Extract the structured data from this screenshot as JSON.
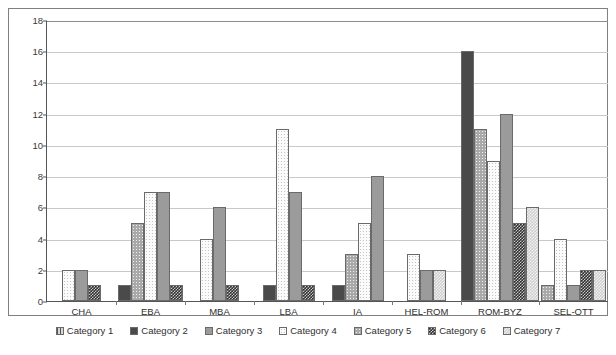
{
  "chart_data": {
    "type": "bar",
    "title": "",
    "xlabel": "",
    "ylabel": "",
    "ylim": [
      0,
      18
    ],
    "yticks": [
      0,
      2,
      4,
      6,
      8,
      10,
      12,
      14,
      16,
      18
    ],
    "grid": true,
    "legend_position": "bottom",
    "categories": [
      "CHA",
      "EBA",
      "MBA",
      "LBA",
      "IA",
      "HEL-ROM",
      "ROM-BYZ",
      "SEL-OTT"
    ],
    "series": [
      {
        "name": "Category 1",
        "values": [
          0,
          0,
          0,
          0,
          0,
          0,
          0,
          0
        ]
      },
      {
        "name": "Category 2",
        "values": [
          0,
          1,
          0,
          1,
          1,
          0,
          16,
          0
        ]
      },
      {
        "name": "Category 3",
        "values": [
          2,
          7,
          6,
          7,
          8,
          2,
          12,
          1
        ]
      },
      {
        "name": "Category 4",
        "values": [
          2,
          7,
          4,
          11,
          5,
          3,
          9,
          4
        ]
      },
      {
        "name": "Category 5",
        "values": [
          0,
          5,
          0,
          0,
          3,
          0,
          11,
          1
        ]
      },
      {
        "name": "Category 6",
        "values": [
          1,
          1,
          1,
          1,
          0,
          0,
          5,
          2
        ]
      },
      {
        "name": "Category 7",
        "values": [
          0,
          0,
          0,
          0,
          0,
          2,
          6,
          2
        ]
      }
    ],
    "bar_order_per_group": [
      [
        "Category 4",
        "Category 3",
        "Category 6"
      ],
      [
        "Category 2",
        "Category 5",
        "Category 4",
        "Category 3",
        "Category 6"
      ],
      [
        "Category 4",
        "Category 3",
        "Category 6"
      ],
      [
        "Category 2",
        "Category 4",
        "Category 3",
        "Category 6"
      ],
      [
        "Category 2",
        "Category 5",
        "Category 4",
        "Category 3"
      ],
      [
        "Category 4",
        "Category 3",
        "Category 7"
      ],
      [
        "Category 2",
        "Category 5",
        "Category 4",
        "Category 3",
        "Category 6",
        "Category 7"
      ],
      [
        "Category 5",
        "Category 4",
        "Category 3",
        "Category 6",
        "Category 7"
      ]
    ]
  },
  "legend": {
    "items": [
      {
        "label": "Category 1",
        "swatch": "cat1"
      },
      {
        "label": "Category 2",
        "swatch": "cat2"
      },
      {
        "label": "Category 3",
        "swatch": "cat3"
      },
      {
        "label": "Category 4",
        "swatch": "cat4"
      },
      {
        "label": "Category 5",
        "swatch": "cat5"
      },
      {
        "label": "Category 6",
        "swatch": "cat6"
      },
      {
        "label": "Category 7",
        "swatch": "cat7"
      }
    ]
  },
  "axis": {
    "y_tick_labels": [
      "0",
      "2",
      "4",
      "6",
      "8",
      "10",
      "12",
      "14",
      "16",
      "18"
    ],
    "x_tick_labels": [
      "CHA",
      "EBA",
      "MBA",
      "LBA",
      "IA",
      "HEL-ROM",
      "ROM-BYZ",
      "SEL-OTT"
    ]
  },
  "colors": {
    "frame": "#808080",
    "gridline": "#c9c9c9",
    "axis": "#555555",
    "text": "#2e2e2e"
  }
}
